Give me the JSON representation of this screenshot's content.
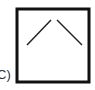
{
  "figure": {
    "label": "C)",
    "box": {
      "x": 17,
      "y": 9,
      "width": 72,
      "height": 73,
      "stroke": "#111111",
      "stroke_width": 3
    },
    "lines": [
      {
        "x1": 27,
        "y1": 45,
        "x2": 51,
        "y2": 20,
        "stroke": "#222222"
      },
      {
        "x1": 57,
        "y1": 20,
        "x2": 82,
        "y2": 45,
        "stroke": "#222222"
      }
    ]
  }
}
